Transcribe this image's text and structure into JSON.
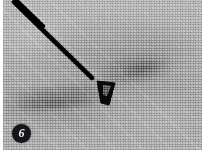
{
  "figure": {
    "panel_label": "6",
    "modality": "ultrasound",
    "caption": "",
    "colors": {
      "background": "#ffffff",
      "tissue_base": "#bdbdbd",
      "needle": "#101010",
      "marker": "#0c0c0c",
      "badge_fill": "#15161a",
      "badge_text": "#f2f2f2"
    }
  },
  "annotations": {
    "badge": {
      "name": "panel-number-badge",
      "text": "6",
      "x": 19,
      "y": 134
    },
    "needle": {
      "name": "needle-track",
      "description": "needle",
      "start_x": 14,
      "start_y": 4,
      "end_x": 92,
      "end_y": 80,
      "thickness": 4
    },
    "marker": {
      "name": "tissue-marker-clip",
      "description": "marker",
      "x": 104,
      "y": 93,
      "width": 18,
      "height": 22
    },
    "lesion": {
      "name": "hypoechoic-lesion",
      "description": "lesion",
      "x": 134,
      "y": 69
    }
  },
  "image_meta": {
    "width": 205,
    "height": 158
  }
}
